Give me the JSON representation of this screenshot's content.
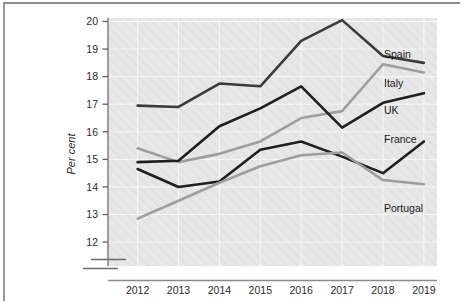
{
  "chart_data": {
    "type": "line",
    "title": "",
    "xlabel": "",
    "ylabel": "Per cent",
    "categories": [
      "2012",
      "2013",
      "2014",
      "2015",
      "2016",
      "2017",
      "2018",
      "2019"
    ],
    "x": [
      2012,
      2013,
      2014,
      2015,
      2016,
      2017,
      2018,
      2019
    ],
    "ylim": [
      12,
      20
    ],
    "yticks": [
      12,
      13,
      14,
      15,
      16,
      17,
      18,
      19,
      20
    ],
    "ytick_labels": [
      "12",
      "13",
      "14",
      "15",
      "16",
      "17",
      "18",
      "19",
      "20"
    ],
    "grid": true,
    "legend_position": "right-inline",
    "axis_break": true,
    "series": [
      {
        "name": "Spain",
        "color": "#3b3b3b",
        "values": [
          16.95,
          16.9,
          17.75,
          17.65,
          19.3,
          20.05,
          18.75,
          18.5
        ]
      },
      {
        "name": "Italy",
        "color": "#9e9e9e",
        "values": [
          15.4,
          14.9,
          15.2,
          15.65,
          16.5,
          16.75,
          18.45,
          18.15
        ]
      },
      {
        "name": "UK",
        "color": "#1f1f1f",
        "values": [
          14.9,
          14.95,
          16.2,
          16.85,
          17.65,
          16.15,
          17.05,
          17.4
        ]
      },
      {
        "name": "France",
        "color": "#1f1f1f",
        "values": [
          14.65,
          14.0,
          14.2,
          15.35,
          15.65,
          15.1,
          14.5,
          15.65
        ]
      },
      {
        "name": "Portugal",
        "color": "#9e9e9e",
        "values": [
          12.85,
          13.5,
          14.15,
          14.75,
          15.15,
          15.25,
          14.25,
          14.1
        ]
      }
    ],
    "annotations": [
      {
        "text": "Spain",
        "series": "Spain"
      },
      {
        "text": "Italy",
        "series": "Italy"
      },
      {
        "text": "UK",
        "series": "UK"
      },
      {
        "text": "France",
        "series": "France"
      },
      {
        "text": "Portugal",
        "series": "Portugal"
      }
    ]
  },
  "figure": {
    "plot_background": "#e6e6e6",
    "grid_color": "#f5f5f5",
    "axis_color": "#7a7a7a"
  },
  "caption": {
    "text": "The chart suggests that Spain's labour income gap was the highest ROCE over the eight"
  }
}
